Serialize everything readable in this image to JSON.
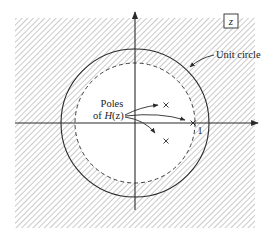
{
  "diagram": {
    "plane_label": "z",
    "unit_circle_label": "Unit circle",
    "poles_label_line1": "Poles",
    "poles_label_line2_prefix": "of ",
    "poles_label_func": "H",
    "poles_label_arg": "(z)",
    "real_axis_tick_label": "1",
    "colors": {
      "line": "#2a2a2a",
      "hatch": "#b4b4b4",
      "background": "#ffffff"
    },
    "geometry": {
      "center": [
        135,
        123
      ],
      "unit_circle_radius": 74,
      "roc_boundary_radius": 60,
      "roc_boundary_style": "dashed"
    },
    "poles": [
      {
        "x": 166,
        "y": 105,
        "description": "complex pole upper"
      },
      {
        "x": 193,
        "y": 123,
        "description": "real pole on positive real axis"
      },
      {
        "x": 166,
        "y": 141,
        "description": "complex pole lower"
      }
    ],
    "region_of_convergence": "hatched region outside dashed circle (includes unit circle)"
  }
}
